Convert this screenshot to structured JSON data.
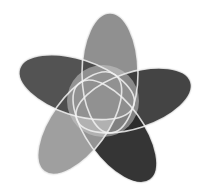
{
  "diagram": {
    "type": "five-set-venn",
    "background": "#ffffff",
    "stroke_color": "#f2f2f2",
    "center": [
      103,
      103
    ],
    "sets": [
      {
        "name": "set-top",
        "angle": -90,
        "fill": "#8a8a8a",
        "opacity": 0.95
      },
      {
        "name": "set-right",
        "angle": -18,
        "fill": "#3a3a3a",
        "opacity": 0.95
      },
      {
        "name": "set-bottom-right",
        "angle": 54,
        "fill": "#2a2a2a",
        "opacity": 0.95
      },
      {
        "name": "set-bottom-left",
        "angle": 126,
        "fill": "#9a9a9a",
        "opacity": 0.95
      },
      {
        "name": "set-left",
        "angle": 198,
        "fill": "#4a4a4a",
        "opacity": 0.95
      }
    ]
  }
}
